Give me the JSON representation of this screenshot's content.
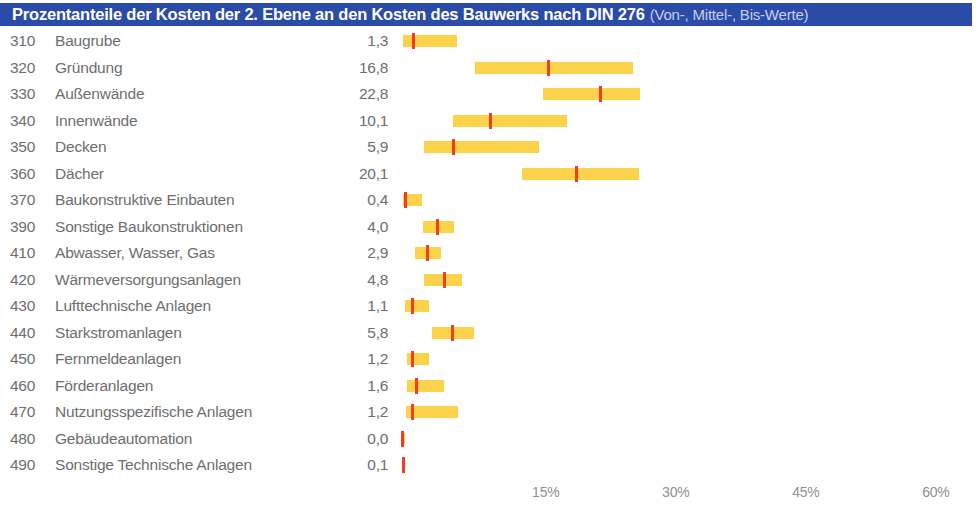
{
  "title": {
    "main": "Prozentanteile der Kosten der 2. Ebene an den Kosten des Bauwerks nach DIN 276",
    "sub": "(Von-, Mittel-, Bis-Werte)"
  },
  "colors": {
    "title_bar": "#2b4ba8",
    "title_text": "#ffffff",
    "title_sub_text": "#c8cfe8",
    "range_bar": "#fbd24a",
    "mid_marker": "#ef3e23",
    "label_text": "#6d6e70",
    "axis_text": "#8e9093",
    "background": "#ffffff"
  },
  "chart_data": {
    "type": "bar",
    "title": "Prozentanteile der Kosten der 2. Ebene an den Kosten des Bauwerks nach DIN 276 (Von-, Mittel-, Bis-Werte)",
    "xlabel": "",
    "ylabel": "",
    "xlim": [
      0,
      66
    ],
    "grid": false,
    "legend": "none",
    "orientation": "horizontal",
    "value_encoding": "floating range bar (Von – Bis) with Mittel marker",
    "axis_ticks": [
      {
        "label": "15%",
        "value": 15
      },
      {
        "label": "30%",
        "value": 30
      },
      {
        "label": "45%",
        "value": 45
      },
      {
        "label": "60%",
        "value": 60
      }
    ],
    "categories": [
      "310 Baugrube",
      "320 Gründung",
      "330 Außenwände",
      "340 Innenwände",
      "350 Decken",
      "360 Dächer",
      "370 Baukonstruktive Einbauten",
      "390 Sonstige Baukonstruktionen",
      "410 Abwasser, Wasser, Gas",
      "420 Wärmeversorgungsanlagen",
      "430 Lufttechnische Anlagen",
      "440 Starkstromanlagen",
      "450 Fernmeldeanlagen",
      "460 Förderanlagen",
      "470 Nutzungsspezifische Anlagen",
      "480 Gebäudeautomation",
      "490 Sonstige Technische Anlagen"
    ],
    "series": [
      {
        "name": "Von",
        "values": [
          0.1,
          8.4,
          16.3,
          5.9,
          2.5,
          13.8,
          0.1,
          2.4,
          1.5,
          2.5,
          0.4,
          3.5,
          0.6,
          0.6,
          0.5,
          0.0,
          0.0
        ]
      },
      {
        "name": "Mittel",
        "values": [
          1.3,
          16.8,
          22.8,
          10.1,
          5.9,
          20.1,
          0.4,
          4.0,
          2.9,
          4.8,
          1.1,
          5.8,
          1.2,
          1.6,
          1.2,
          0.0,
          0.1
        ]
      },
      {
        "name": "Bis",
        "values": [
          6.4,
          26.6,
          27.4,
          19.0,
          15.8,
          27.3,
          2.3,
          6.0,
          4.5,
          6.9,
          3.1,
          8.3,
          3.1,
          4.9,
          6.5,
          0.3,
          0.3
        ]
      }
    ]
  },
  "rows": [
    {
      "code": "310",
      "label": "Baugrube",
      "mid_text": "1,3",
      "von": 0.1,
      "mittel": 1.3,
      "bis": 6.4
    },
    {
      "code": "320",
      "label": "Gründung",
      "mid_text": "16,8",
      "von": 8.4,
      "mittel": 16.8,
      "bis": 26.6
    },
    {
      "code": "330",
      "label": "Außenwände",
      "mid_text": "22,8",
      "von": 16.3,
      "mittel": 22.8,
      "bis": 27.4
    },
    {
      "code": "340",
      "label": "Innenwände",
      "mid_text": "10,1",
      "von": 5.9,
      "mittel": 10.1,
      "bis": 19.0
    },
    {
      "code": "350",
      "label": "Decken",
      "mid_text": "5,9",
      "von": 2.5,
      "mittel": 5.9,
      "bis": 15.8
    },
    {
      "code": "360",
      "label": "Dächer",
      "mid_text": "20,1",
      "von": 13.8,
      "mittel": 20.1,
      "bis": 27.3
    },
    {
      "code": "370",
      "label": "Baukonstruktive Einbauten",
      "mid_text": "0,4",
      "von": 0.1,
      "mittel": 0.4,
      "bis": 2.3
    },
    {
      "code": "390",
      "label": "Sonstige Baukonstruktionen",
      "mid_text": "4,0",
      "von": 2.4,
      "mittel": 4.0,
      "bis": 6.0
    },
    {
      "code": "410",
      "label": "Abwasser, Wasser, Gas",
      "mid_text": "2,9",
      "von": 1.5,
      "mittel": 2.9,
      "bis": 4.5
    },
    {
      "code": "420",
      "label": "Wärmeversorgungsanlagen",
      "mid_text": "4,8",
      "von": 2.5,
      "mittel": 4.8,
      "bis": 6.9
    },
    {
      "code": "430",
      "label": "Lufttechnische Anlagen",
      "mid_text": "1,1",
      "von": 0.4,
      "mittel": 1.1,
      "bis": 3.1
    },
    {
      "code": "440",
      "label": "Starkstromanlagen",
      "mid_text": "5,8",
      "von": 3.5,
      "mittel": 5.8,
      "bis": 8.3
    },
    {
      "code": "450",
      "label": "Fernmeldeanlagen",
      "mid_text": "1,2",
      "von": 0.6,
      "mittel": 1.2,
      "bis": 3.1
    },
    {
      "code": "460",
      "label": "Förderanlagen",
      "mid_text": "1,6",
      "von": 0.6,
      "mittel": 1.6,
      "bis": 4.9
    },
    {
      "code": "470",
      "label": "Nutzungsspezifische Anlagen",
      "mid_text": "1,2",
      "von": 0.5,
      "mittel": 1.2,
      "bis": 6.5
    },
    {
      "code": "480",
      "label": "Gebäudeautomation",
      "mid_text": "0,0",
      "von": 0.0,
      "mittel": 0.0,
      "bis": 0.3
    },
    {
      "code": "490",
      "label": "Sonstige Technische Anlagen",
      "mid_text": "0,1",
      "von": 0.0,
      "mittel": 0.1,
      "bis": 0.3
    }
  ],
  "axis": {
    "ticks": [
      "15%",
      "30%",
      "45%",
      "60%"
    ]
  }
}
